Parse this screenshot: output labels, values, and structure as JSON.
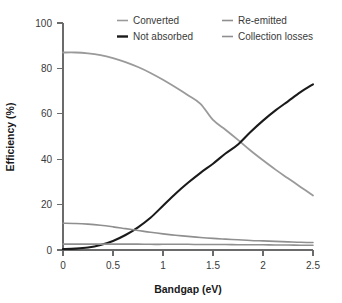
{
  "chart_data": {
    "type": "line",
    "title": "",
    "xlabel": "Bandgap (eV)",
    "ylabel": "Efficiency (%)",
    "xlim": [
      0,
      2.5
    ],
    "ylim": [
      0,
      100
    ],
    "xticks": [
      "0",
      "0.5",
      "1",
      "1.5",
      "2",
      "2.5"
    ],
    "xtick_values": [
      0,
      0.5,
      1,
      1.5,
      2,
      2.5
    ],
    "yticks": [
      "0",
      "20",
      "40",
      "60",
      "80",
      "100"
    ],
    "ytick_values": [
      0,
      20,
      40,
      60,
      80,
      100
    ],
    "grid": false,
    "legend_position": "top",
    "x": [
      0,
      0.125,
      0.25,
      0.375,
      0.5,
      0.625,
      0.75,
      0.875,
      1,
      1.125,
      1.25,
      1.375,
      1.5,
      1.625,
      1.75,
      1.875,
      2,
      2.125,
      2.25,
      2.375,
      2.5
    ],
    "series": [
      {
        "name": "Converted",
        "color": "#9a9a9a",
        "width": 1.8,
        "values": [
          87,
          87,
          86.6,
          85.8,
          84.5,
          82.8,
          80.6,
          78,
          75,
          71.7,
          68.2,
          64.4,
          57.3,
          53,
          48.5,
          43.8,
          39.5,
          35.4,
          31.6,
          27.8,
          24
        ]
      },
      {
        "name": "Not absorbed",
        "color": "#1a1a1a",
        "width": 2.1,
        "values": [
          0.4,
          0.6,
          1.1,
          2.2,
          4,
          6.6,
          10,
          14.2,
          19.5,
          24.8,
          29.6,
          34,
          38,
          42.5,
          46.5,
          52,
          57,
          61.5,
          65.5,
          69.5,
          73
        ]
      },
      {
        "name": "Re-emitted",
        "color": "#8f8f8f",
        "width": 1.6,
        "values": [
          11.8,
          11.7,
          11.4,
          10.9,
          10.2,
          9.4,
          8.6,
          7.8,
          7.1,
          6.5,
          6,
          5.5,
          5.1,
          4.8,
          4.5,
          4.2,
          4,
          3.8,
          3.6,
          3.4,
          3.3
        ]
      },
      {
        "name": "Collection losses",
        "color": "#8f8f8f",
        "width": 1.6,
        "values": [
          2.6,
          2.6,
          2.6,
          2.6,
          2.6,
          2.6,
          2.6,
          2.5,
          2.5,
          2.5,
          2.5,
          2.4,
          2.4,
          2.4,
          2.3,
          2.3,
          2.3,
          2.2,
          2.2,
          2.1,
          2.1
        ]
      }
    ]
  },
  "legend": {
    "entries": [
      {
        "label": "Converted",
        "color": "#9a9a9a",
        "bold": false
      },
      {
        "label": "Re-emitted",
        "color": "#8f8f8f",
        "bold": false
      },
      {
        "label": "Not absorbed",
        "color": "#1a1a1a",
        "bold": true
      },
      {
        "label": "Collection losses",
        "color": "#8f8f8f",
        "bold": false
      }
    ]
  },
  "axes": {
    "x_title": "Bandgap (eV)",
    "y_title": "Efficiency (%)",
    "x_tick_labels": [
      "0",
      "0.5",
      "1",
      "1.5",
      "2",
      "2.5"
    ],
    "y_tick_labels": [
      "0",
      "20",
      "40",
      "60",
      "80",
      "100"
    ]
  },
  "colors": {
    "axis": "#6b6b6b",
    "text": "#3a3a3a",
    "title": "#1a1a1a",
    "background": "#ffffff"
  }
}
